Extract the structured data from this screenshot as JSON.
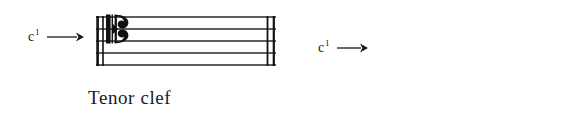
{
  "figure": {
    "background_color": "#ffffff",
    "ink_color": "#1a1a1a",
    "examples": [
      {
        "id": "tenor",
        "caption": "Tenor clef",
        "pitch_label_base": "c",
        "pitch_label_superscript": "1",
        "arrow_icon": "right-arrow-icon",
        "clef_icon": "c-clef-icon",
        "clef_name": "C clef",
        "staff_line_count": 5,
        "clef_center_line_from_bottom": 4,
        "barline_left_style": "double thin",
        "barline_right_style": "double thin",
        "pointed_note": "c1"
      },
      {
        "id": "alto",
        "caption": "Alto clef",
        "pitch_label_base": "c",
        "pitch_label_superscript": "1",
        "arrow_icon": "right-arrow-icon",
        "clef_icon": "c-clef-icon",
        "clef_name": "C clef",
        "staff_line_count": 5,
        "clef_center_line_from_bottom": 3,
        "barline_left_style": "double thin",
        "barline_right_style": "double thin",
        "pointed_note": "c1"
      }
    ]
  }
}
